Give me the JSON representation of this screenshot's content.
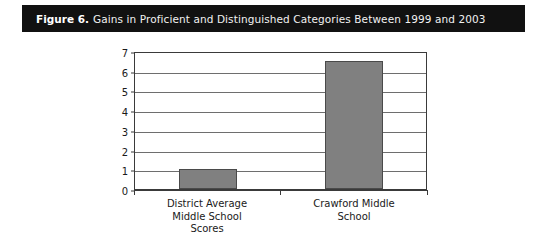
{
  "figure": {
    "label": "Figure 6.",
    "caption": "Gains in Proficient and Distinguished Categories Between 1999 and 2003"
  },
  "chart_data": {
    "type": "bar",
    "title": "Gains in Proficient and Distinguished Categories Between 1999 and 2003",
    "categories": [
      "District Average Middle School Scores",
      "Crawford Middle School"
    ],
    "category_lines": [
      [
        "District Average",
        "Middle School",
        "Scores"
      ],
      [
        "Crawford Middle",
        "School"
      ]
    ],
    "values": [
      1,
      6.5
    ],
    "xlabel": "",
    "ylabel": "",
    "ylim": [
      0,
      7
    ],
    "ytick_labels": [
      "0",
      "1",
      "2",
      "3",
      "4",
      "5",
      "6",
      "7"
    ],
    "ytick_values": [
      0,
      1,
      2,
      3,
      4,
      5,
      6,
      7
    ],
    "grid": true,
    "legend": false,
    "bar_color": "#808080",
    "bar_border_color": "#4a4a4a",
    "gridline_color": "#6e6e6e",
    "axis_color": "#3a3a3a",
    "background": "#ffffff",
    "title_bar_color": "#111111",
    "title_text_color": "#f2f2f2"
  }
}
